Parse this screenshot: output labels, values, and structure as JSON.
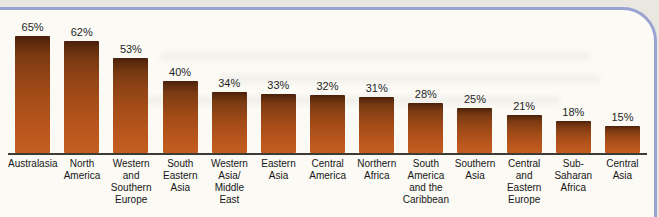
{
  "figure": {
    "style": "scanned textbook bar chart",
    "border_color": "#9aa3d2",
    "panel_background": "#fbfaf5",
    "page_background": "#e9e7e0",
    "bar_top_color": "#48200a",
    "bar_bottom_color": "#c25e20",
    "baseline_color": "#3e3a34",
    "text_color": "#1f1f1f"
  },
  "chart_data": {
    "type": "bar",
    "title": "",
    "xlabel": "",
    "ylabel": "",
    "unit": "%",
    "ylim": [
      0,
      70
    ],
    "grid": false,
    "legend": false,
    "categories": [
      "Australasia",
      "North America",
      "Western and Southern Europe",
      "South Eastern Asia",
      "Western Asia/ Middle East",
      "Eastern Asia",
      "Central America",
      "Northern Africa",
      "South America and the Caribbean",
      "Southern Asia",
      "Central and Eastern Europe",
      "Sub-Saharan Africa",
      "Central Asia"
    ],
    "values": [
      65,
      62,
      53,
      40,
      34,
      33,
      32,
      31,
      28,
      25,
      21,
      18,
      15
    ],
    "value_labels": [
      "65%",
      "62%",
      "53%",
      "40%",
      "34%",
      "33%",
      "32%",
      "31%",
      "28%",
      "25%",
      "21%",
      "18%",
      "15%"
    ],
    "category_lines": [
      [
        "Australasia"
      ],
      [
        "North",
        "America"
      ],
      [
        "Western",
        "and",
        "Southern",
        "Europe"
      ],
      [
        "South",
        "Eastern",
        "Asia"
      ],
      [
        "Western",
        "Asia/",
        "Middle",
        "East"
      ],
      [
        "Eastern",
        "Asia"
      ],
      [
        "Central",
        "America"
      ],
      [
        "Northern",
        "Africa"
      ],
      [
        "South",
        "America",
        "and the",
        "Caribbean"
      ],
      [
        "Southern",
        "Asia"
      ],
      [
        "Central",
        "and",
        "Eastern",
        "Europe"
      ],
      [
        "Sub-",
        "Saharan",
        "Africa"
      ],
      [
        "Central",
        "Asia"
      ]
    ]
  }
}
